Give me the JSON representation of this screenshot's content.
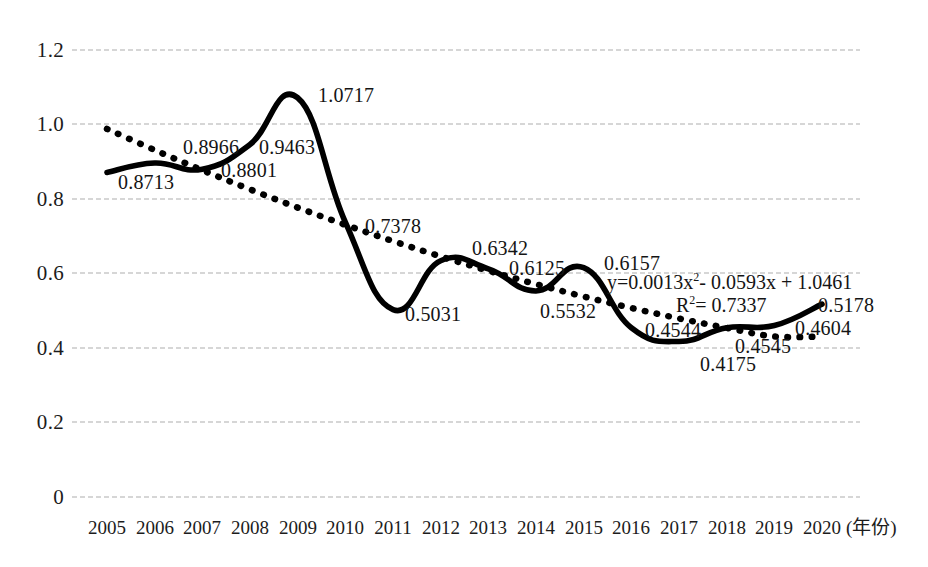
{
  "chart_data": {
    "type": "line",
    "title": "",
    "xlabel": "年份",
    "ylabel": "",
    "xlim": [
      2005,
      2020
    ],
    "ylim": [
      0,
      1.2
    ],
    "grid": true,
    "legend_position": "none",
    "categories": [
      "2005",
      "2006",
      "2007",
      "2008",
      "2009",
      "2010",
      "2011",
      "2012",
      "2013",
      "2014",
      "2015",
      "2016",
      "2017",
      "2018",
      "2019",
      "2020"
    ],
    "series": [
      {
        "name": "实测值",
        "style": "solid",
        "color": "#000000",
        "values": [
          0.8713,
          0.8966,
          0.8801,
          0.9463,
          1.0717,
          0.7378,
          0.5031,
          0.6342,
          0.6125,
          0.5532,
          0.6157,
          0.4544,
          0.4175,
          0.4545,
          0.4604,
          0.5178
        ]
      },
      {
        "name": "趋势线",
        "style": "dotted",
        "color": "#000000",
        "values": [
          0.9881,
          0.9314,
          0.8773,
          0.8258,
          0.7769,
          0.7306,
          0.6869,
          0.6458,
          0.6073,
          0.5714,
          0.5381,
          0.5074,
          0.4793,
          0.4538,
          0.4309,
          0.4306
        ]
      }
    ],
    "data_labels": [
      "0.8713",
      "0.8966",
      "0.8801",
      "0.9463",
      "1.0717",
      "0.7378",
      "0.5031",
      "0.6342",
      "0.6125",
      "0.5532",
      "0.6157",
      "0.4544",
      "0.4175",
      "0.4545",
      "0.4604",
      "0.5178"
    ],
    "y_ticks": [
      "0",
      "0.2",
      "0.4",
      "0.6",
      "0.8",
      "1.0",
      "1.2"
    ],
    "y_tick_values": [
      0,
      0.2,
      0.4,
      0.6,
      0.8,
      1.0,
      1.2
    ],
    "x_ticks": [
      "2005",
      "2006",
      "2007",
      "2008",
      "2009",
      "2010",
      "2011",
      "2012",
      "2013",
      "2014",
      "2015",
      "2016",
      "2017",
      "2018",
      "2019",
      "2020"
    ],
    "annotations": {
      "equation_prefix": "y=0.0013x",
      "equation_exponent": "2",
      "equation_suffix": "- 0.0593x + 1.0461",
      "equation_full": "y=0.0013x2 - 0.0593x + 1.0461",
      "r2_prefix": "R",
      "r2_exponent": "2",
      "r2_suffix": "= 0.7337",
      "r2_full": "R2= 0.7337"
    },
    "axis_suffix_label": "(年份)",
    "colors": {
      "gridline": "#c9c9c9",
      "line": "#000000",
      "text": "#1a1a1a",
      "background": "#ffffff"
    }
  }
}
